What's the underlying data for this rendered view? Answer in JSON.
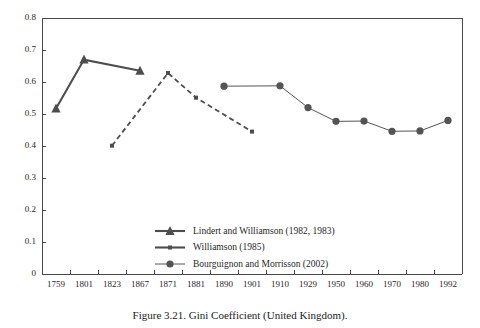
{
  "caption": "Figure 3.21.  Gini Coefficient (United Kingdom).",
  "chart_data": {
    "type": "line",
    "title": "Gini Coefficient (United Kingdom)",
    "xlabel": "",
    "ylabel": "",
    "ylim": [
      0,
      0.8
    ],
    "ytick_labels": [
      "0.8",
      "0.7",
      "0.6",
      "0.5",
      "0.4",
      "0.3",
      "0.2",
      "0.1",
      "0"
    ],
    "ytick_values": [
      0.8,
      0.7,
      0.6,
      0.5,
      0.4,
      0.3,
      0.2,
      0.1,
      0
    ],
    "grid": false,
    "legend_position": "inside-bottom-center",
    "categories": [
      "1759",
      "1801",
      "1823",
      "1867",
      "1871",
      "1881",
      "1890",
      "1901",
      "1910",
      "1929",
      "1950",
      "1960",
      "1970",
      "1980",
      "1992"
    ],
    "series": [
      {
        "name": "Lindert and Williamson (1982, 1983)",
        "marker": "triangle",
        "linestyle": "solid-thick",
        "color": "#4d4d4d",
        "points": [
          {
            "x": "1759",
            "y": 0.517
          },
          {
            "x": "1801",
            "y": 0.67
          },
          {
            "x": "1867",
            "y": 0.635
          }
        ]
      },
      {
        "name": "Williamson (1985)",
        "marker": "square",
        "linestyle": "dashed",
        "color": "#4d4d4d",
        "points": [
          {
            "x": "1823",
            "y": 0.401
          },
          {
            "x": "1871",
            "y": 0.628
          },
          {
            "x": "1881",
            "y": 0.551
          },
          {
            "x": "1901",
            "y": 0.445
          }
        ]
      },
      {
        "name": "Bourguignon and Morrisson (2002)",
        "marker": "circle",
        "linestyle": "solid-thin",
        "color": "#545454",
        "points": [
          {
            "x": "1890",
            "y": 0.587
          },
          {
            "x": "1910",
            "y": 0.588
          },
          {
            "x": "1929",
            "y": 0.52
          },
          {
            "x": "1950",
            "y": 0.477
          },
          {
            "x": "1960",
            "y": 0.478
          },
          {
            "x": "1970",
            "y": 0.446
          },
          {
            "x": "1980",
            "y": 0.447
          },
          {
            "x": "1992",
            "y": 0.48
          }
        ]
      }
    ]
  },
  "legend": {
    "items": [
      {
        "label": "Lindert and Williamson (1982, 1983)",
        "marker": "triangle",
        "linestyle": "solid-thick"
      },
      {
        "label": "Williamson (1985)",
        "marker": "square",
        "linestyle": "solid-thick"
      },
      {
        "label": "Bourguignon and Morrisson (2002)",
        "marker": "circle",
        "linestyle": "solid-thin"
      }
    ]
  }
}
